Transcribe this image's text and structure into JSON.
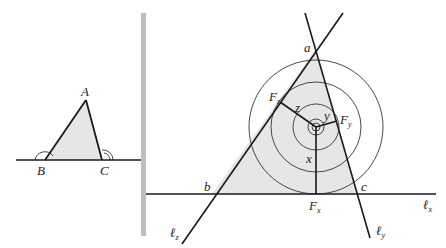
{
  "colors": {
    "stroke": "#1a1a1a",
    "fill": "#e6e6e6",
    "divider": "#bdbdbd"
  },
  "left_figure": {
    "vertices": {
      "A": "A",
      "B": "B",
      "C": "C"
    }
  },
  "right_figure": {
    "vertices": {
      "a": "a",
      "b": "b",
      "c": "c"
    },
    "feet": {
      "Fx": "F",
      "Fx_sub": "x",
      "Fy": "F",
      "Fy_sub": "y",
      "Fz": "F",
      "Fz_sub": "z"
    },
    "distances": {
      "x": "x",
      "y": "y",
      "z": "z"
    },
    "lines": {
      "lx": "ℓ",
      "lx_sub": "x",
      "ly": "ℓ",
      "ly_sub": "y",
      "lz": "ℓ",
      "lz_sub": "z"
    }
  }
}
